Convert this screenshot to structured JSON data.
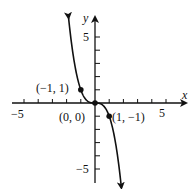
{
  "chart_data": {
    "type": "line",
    "title": "",
    "function": "y = -x^3",
    "xlabel": "x",
    "ylabel": "y",
    "xlim": [
      -5,
      5
    ],
    "ylim": [
      -5,
      5
    ],
    "x_tick_labels": [
      "-5",
      "5"
    ],
    "y_tick_labels": [
      "5",
      "-5"
    ],
    "grid": false,
    "points": [
      {
        "x": -1,
        "y": 1,
        "label": "(−1, 1)"
      },
      {
        "x": 0,
        "y": 0,
        "label": "(0, 0)"
      },
      {
        "x": 1,
        "y": -1,
        "label": "(1, −1)"
      }
    ],
    "curve_color": "#111111",
    "axis_color": "#111111"
  },
  "labels": {
    "x_axis": "x",
    "y_axis": "y",
    "x_neg5": "−5",
    "x_pos5": "5",
    "y_pos5": "5",
    "y_neg5": "−5",
    "pt_a": "(−1, 1)",
    "pt_b": "(0, 0)",
    "pt_c": "(1, −1)"
  }
}
